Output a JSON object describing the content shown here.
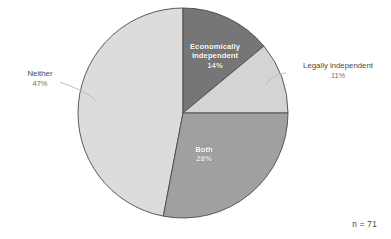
{
  "chart_data": {
    "type": "pie",
    "title": "",
    "subtitle": "",
    "xlabel": "",
    "ylabel": "",
    "legend_position": "none",
    "grid": false,
    "start_angle_deg": 0,
    "direction": "clockwise",
    "total_percent": 100,
    "sample_size_label": "n = 71",
    "sample_size": 71,
    "categories": [
      "Economically independent",
      "Legally independent",
      "Both",
      "Neither"
    ],
    "values": [
      14,
      11,
      28,
      47
    ],
    "slices": [
      {
        "label": "Economically independent",
        "percent_text": "14%",
        "value": 14,
        "color": "#767676",
        "label_placement": "inside",
        "label_color": "#ffffff"
      },
      {
        "label": "Legally independent",
        "percent_text": "11%",
        "value": 11,
        "color": "#d4d4d4",
        "label_placement": "outside",
        "label_color": "#4a4a4a"
      },
      {
        "label": "Both",
        "percent_text": "28%",
        "value": 28,
        "color": "#a0a0a0",
        "label_placement": "inside",
        "label_color": "#ffffff"
      },
      {
        "label": "Neither",
        "percent_text": "47%",
        "value": 47,
        "color": "#dcdcdc",
        "label_placement": "outside",
        "label_color": "#4a4a4a"
      }
    ]
  },
  "colors": {
    "background": "#ffffff",
    "slice_border": "#4a4a4a",
    "leader_line": "#b9b9b9",
    "text": "#4a4a4a",
    "inside_text": "#ffffff"
  },
  "footer": {
    "sample_size": "n = 71"
  }
}
